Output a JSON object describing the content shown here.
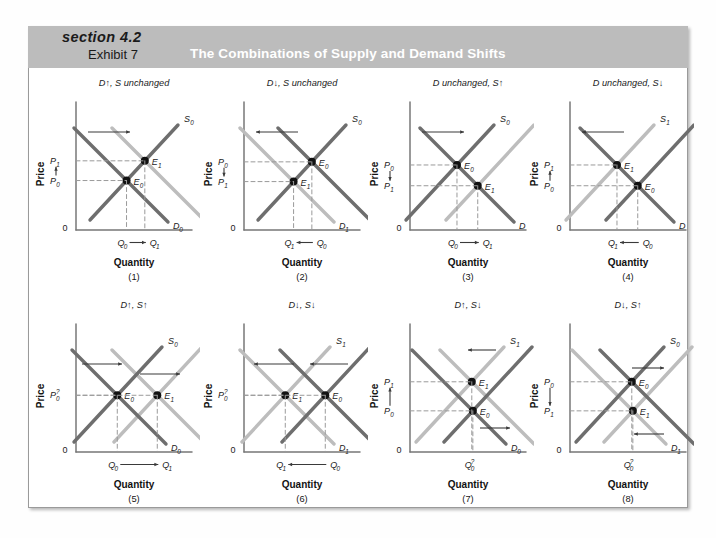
{
  "header": {
    "section_label": "section 4.2",
    "exhibit_label": "Exhibit 7",
    "title": "The Combinations of Supply and Demand Shifts",
    "band_color": "#bcbcbc",
    "title_color": "#ffffff"
  },
  "style": {
    "dark_curve_color": "#6e6e6e",
    "light_curve_color": "#bdbdbd",
    "axis_color": "#777777",
    "dash_color": "#9a9a9a",
    "point_color": "#111111",
    "arrow_color": "#3a3a3a"
  },
  "axes": {
    "price_label": "Price",
    "quantity_label": "Quantity",
    "origin_label": "0"
  },
  "chart_data": {
    "type": "line",
    "title": "The Combinations of Supply and Demand Shifts",
    "xlabel": "Quantity",
    "ylabel": "Price",
    "grid": false,
    "legend": "inline-curve-labels",
    "panels": [
      {
        "number": "(1)",
        "title": "D↑, S unchanged",
        "shift": {
          "demand": "increase",
          "supply": "unchanged"
        },
        "curves": [
          {
            "name": "S0",
            "label": "S",
            "sub": "0",
            "type": "supply",
            "tone": "dark"
          },
          {
            "name": "D0",
            "label": "D",
            "sub": "0",
            "type": "demand",
            "tone": "dark"
          },
          {
            "name": "D1",
            "label": "D",
            "sub": "1",
            "type": "demand",
            "tone": "light"
          }
        ],
        "equilibria": [
          {
            "name": "E0",
            "label": "E",
            "sub": "0"
          },
          {
            "name": "E1",
            "label": "E",
            "sub": "1"
          }
        ],
        "price_axis": {
          "top": "P",
          "top_sub": "1",
          "bottom": "P",
          "bottom_sub": "0",
          "arrow": "up"
        },
        "qty_axis": {
          "left": "Q",
          "left_sub": "0",
          "right": "Q",
          "right_sub": "1",
          "arrow": "right"
        },
        "shift_arrow": "right",
        "price_result": "rises",
        "quantity_result": "rises"
      },
      {
        "number": "(2)",
        "title": "D↓, S unchanged",
        "shift": {
          "demand": "decrease",
          "supply": "unchanged"
        },
        "curves": [
          {
            "name": "S0",
            "label": "S",
            "sub": "0",
            "type": "supply",
            "tone": "dark"
          },
          {
            "name": "D0",
            "label": "D",
            "sub": "0",
            "type": "demand",
            "tone": "dark"
          },
          {
            "name": "D1",
            "label": "D",
            "sub": "1",
            "type": "demand",
            "tone": "light"
          }
        ],
        "equilibria": [
          {
            "name": "E0",
            "label": "E",
            "sub": "0"
          },
          {
            "name": "E1",
            "label": "E",
            "sub": "1"
          }
        ],
        "price_axis": {
          "top": "P",
          "top_sub": "0",
          "bottom": "P",
          "bottom_sub": "1",
          "arrow": "down"
        },
        "qty_axis": {
          "left": "Q",
          "left_sub": "1",
          "right": "Q",
          "right_sub": "0",
          "arrow": "left"
        },
        "shift_arrow": "left",
        "price_result": "falls",
        "quantity_result": "falls"
      },
      {
        "number": "(3)",
        "title": "D unchanged, S↑",
        "shift": {
          "demand": "unchanged",
          "supply": "increase"
        },
        "curves": [
          {
            "name": "S0",
            "label": "S",
            "sub": "0",
            "type": "supply",
            "tone": "dark"
          },
          {
            "name": "S1",
            "label": "S",
            "sub": "1",
            "type": "supply",
            "tone": "light"
          },
          {
            "name": "D",
            "label": "D",
            "sub": "",
            "type": "demand",
            "tone": "dark"
          }
        ],
        "equilibria": [
          {
            "name": "E0",
            "label": "E",
            "sub": "0"
          },
          {
            "name": "E1",
            "label": "E",
            "sub": "1"
          }
        ],
        "price_axis": {
          "top": "P",
          "top_sub": "0",
          "bottom": "P",
          "bottom_sub": "1",
          "arrow": "down"
        },
        "qty_axis": {
          "left": "Q",
          "left_sub": "0",
          "right": "Q",
          "right_sub": "1",
          "arrow": "right"
        },
        "shift_arrow": "right",
        "price_result": "falls",
        "quantity_result": "rises"
      },
      {
        "number": "(4)",
        "title": "D unchanged, S↓",
        "shift": {
          "demand": "unchanged",
          "supply": "decrease"
        },
        "curves": [
          {
            "name": "S0",
            "label": "S",
            "sub": "0",
            "type": "supply",
            "tone": "dark"
          },
          {
            "name": "S1",
            "label": "S",
            "sub": "1",
            "type": "supply",
            "tone": "light"
          },
          {
            "name": "D",
            "label": "D",
            "sub": "",
            "type": "demand",
            "tone": "dark"
          }
        ],
        "equilibria": [
          {
            "name": "E0",
            "label": "E",
            "sub": "0"
          },
          {
            "name": "E1",
            "label": "E",
            "sub": "1"
          }
        ],
        "price_axis": {
          "top": "P",
          "top_sub": "1",
          "bottom": "P",
          "bottom_sub": "0",
          "arrow": "up"
        },
        "qty_axis": {
          "left": "Q",
          "left_sub": "1",
          "right": "Q",
          "right_sub": "0",
          "arrow": "left"
        },
        "shift_arrow": "left",
        "price_result": "rises",
        "quantity_result": "falls"
      },
      {
        "number": "(5)",
        "title": "D↑, S↑",
        "shift": {
          "demand": "increase",
          "supply": "increase"
        },
        "curves": [
          {
            "name": "S0",
            "label": "S",
            "sub": "0",
            "type": "supply",
            "tone": "dark"
          },
          {
            "name": "S1",
            "label": "S",
            "sub": "1",
            "type": "supply",
            "tone": "light"
          },
          {
            "name": "D0",
            "label": "D",
            "sub": "0",
            "type": "demand",
            "tone": "dark"
          },
          {
            "name": "D1",
            "label": "D",
            "sub": "1",
            "type": "demand",
            "tone": "light"
          }
        ],
        "equilibria": [
          {
            "name": "E0",
            "label": "E",
            "sub": "0"
          },
          {
            "name": "E1",
            "label": "E",
            "sub": "1"
          }
        ],
        "price_axis": {
          "single": "P",
          "single_sub": "0",
          "indeterminate": "?"
        },
        "qty_axis": {
          "left": "Q",
          "left_sub": "0",
          "right": "Q",
          "right_sub": "1",
          "arrow": "right"
        },
        "shift_arrow": "right-both",
        "price_result": "indeterminate",
        "quantity_result": "rises"
      },
      {
        "number": "(6)",
        "title": "D↓, S↓",
        "shift": {
          "demand": "decrease",
          "supply": "decrease"
        },
        "curves": [
          {
            "name": "S0",
            "label": "S",
            "sub": "0",
            "type": "supply",
            "tone": "dark"
          },
          {
            "name": "S1",
            "label": "S",
            "sub": "1",
            "type": "supply",
            "tone": "light"
          },
          {
            "name": "D0",
            "label": "D",
            "sub": "0",
            "type": "demand",
            "tone": "dark"
          },
          {
            "name": "D1",
            "label": "D",
            "sub": "1",
            "type": "demand",
            "tone": "light"
          }
        ],
        "equilibria": [
          {
            "name": "E0",
            "label": "E",
            "sub": "0"
          },
          {
            "name": "E1",
            "label": "E",
            "sub": "1"
          }
        ],
        "price_axis": {
          "single": "P",
          "single_sub": "0",
          "indeterminate": "?"
        },
        "qty_axis": {
          "left": "Q",
          "left_sub": "1",
          "right": "Q",
          "right_sub": "0",
          "arrow": "left"
        },
        "shift_arrow": "left-both",
        "price_result": "indeterminate",
        "quantity_result": "falls"
      },
      {
        "number": "(7)",
        "title": "D↑, S↓",
        "shift": {
          "demand": "increase",
          "supply": "decrease"
        },
        "curves": [
          {
            "name": "S0",
            "label": "S",
            "sub": "0",
            "type": "supply",
            "tone": "dark"
          },
          {
            "name": "S1",
            "label": "S",
            "sub": "1",
            "type": "supply",
            "tone": "light"
          },
          {
            "name": "D0",
            "label": "D",
            "sub": "0",
            "type": "demand",
            "tone": "dark"
          },
          {
            "name": "D1",
            "label": "D",
            "sub": "1",
            "type": "demand",
            "tone": "light"
          }
        ],
        "equilibria": [
          {
            "name": "E0",
            "label": "E",
            "sub": "0"
          },
          {
            "name": "E1",
            "label": "E",
            "sub": "1"
          }
        ],
        "price_axis": {
          "top": "P",
          "top_sub": "1",
          "bottom": "P",
          "bottom_sub": "0",
          "arrow": "up"
        },
        "qty_axis": {
          "single": "Q",
          "single_sub": "0",
          "indeterminate": "?"
        },
        "shift_arrow": "mixed",
        "price_result": "rises",
        "quantity_result": "indeterminate"
      },
      {
        "number": "(8)",
        "title": "D↓, S↑",
        "shift": {
          "demand": "decrease",
          "supply": "increase"
        },
        "curves": [
          {
            "name": "S0",
            "label": "S",
            "sub": "0",
            "type": "supply",
            "tone": "dark"
          },
          {
            "name": "S1",
            "label": "S",
            "sub": "1",
            "type": "supply",
            "tone": "light"
          },
          {
            "name": "D0",
            "label": "D",
            "sub": "0",
            "type": "demand",
            "tone": "dark"
          },
          {
            "name": "D1",
            "label": "D",
            "sub": "1",
            "type": "demand",
            "tone": "light"
          }
        ],
        "equilibria": [
          {
            "name": "E0",
            "label": "E",
            "sub": "0"
          },
          {
            "name": "E1",
            "label": "E",
            "sub": "1"
          }
        ],
        "price_axis": {
          "top": "P",
          "top_sub": "0",
          "bottom": "P",
          "bottom_sub": "1",
          "arrow": "down"
        },
        "qty_axis": {
          "single": "Q",
          "single_sub": "0",
          "indeterminate": "?"
        },
        "shift_arrow": "mixed",
        "price_result": "falls",
        "quantity_result": "indeterminate"
      }
    ]
  }
}
